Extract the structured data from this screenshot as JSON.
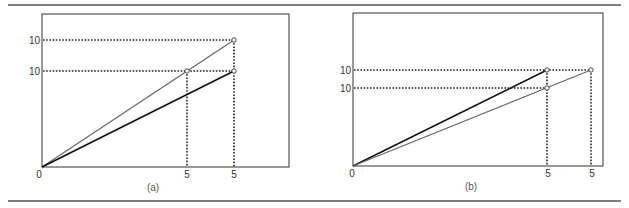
{
  "figure": {
    "colors": {
      "dark_line": "#111111",
      "grey_line": "#666666",
      "frame": "#333333",
      "rule": "#555555"
    },
    "panels": [
      {
        "caption": "(a)",
        "origin_label": "0",
        "y_labels": [
          "10",
          "10"
        ],
        "x_labels": [
          "5",
          "5"
        ],
        "lines": [
          {
            "name": "grey-line",
            "from": [
              0,
              0
            ],
            "to": [
              5,
              10
            ],
            "extends_to_top": true
          },
          {
            "name": "dark-line",
            "from": [
              0,
              0
            ],
            "to": [
              5,
              10
            ]
          }
        ]
      },
      {
        "caption": "(b)",
        "origin_label": "0",
        "y_labels": [
          "10",
          "10"
        ],
        "x_labels": [
          "5",
          "5"
        ],
        "lines": [
          {
            "name": "dark-line",
            "from": [
              0,
              0
            ],
            "to": [
              5,
              10
            ]
          },
          {
            "name": "grey-line",
            "from": [
              0,
              0
            ],
            "to": [
              5,
              10
            ]
          }
        ]
      }
    ]
  }
}
